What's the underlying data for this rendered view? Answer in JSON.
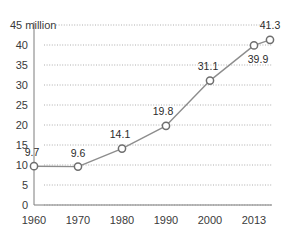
{
  "chart_data": {
    "type": "line",
    "title": "",
    "subtitle": "",
    "xlabel": "",
    "ylabel": "",
    "unit_label": "45 million",
    "ylim": [
      0,
      45
    ],
    "yticks": [
      0,
      5,
      10,
      15,
      20,
      25,
      30,
      35,
      40,
      45
    ],
    "ytick_labels": [
      "0",
      "5",
      "10",
      "15",
      "20",
      "25",
      "30",
      "35",
      "40",
      "45 million"
    ],
    "grid": true,
    "legend": false,
    "categories": [
      "1960",
      "1970",
      "1980",
      "1990",
      "2000",
      "2013",
      ""
    ],
    "xtick_labels": [
      "1960",
      "1970",
      "1980",
      "1990",
      "2000",
      "2013"
    ],
    "values": [
      9.7,
      9.6,
      14.1,
      19.8,
      31.1,
      39.9,
      41.3
    ],
    "point_labels": [
      "9.7",
      "9.6",
      "14.1",
      "19.8",
      "31.1",
      "39.9",
      "41.3"
    ],
    "series": [
      {
        "name": "",
        "values": [
          9.7,
          9.6,
          14.1,
          19.8,
          31.1,
          39.9,
          41.3
        ]
      }
    ],
    "colors": {
      "line": "#8d8d8d",
      "marker_fill": "#ffffff",
      "marker_stroke": "#6e6e6e",
      "grid": "#9a9a9a",
      "axis": "#7d7d7d",
      "text": "#3a3a3a",
      "background": "#ffffff"
    }
  }
}
